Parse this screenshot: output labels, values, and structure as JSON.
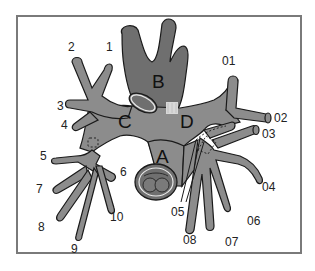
{
  "diagram": {
    "type": "bronchial-tree schematic",
    "colors": {
      "airway_fill": "#8c8c8c",
      "trunk_fill": "#6f6f6f",
      "outline": "#1a1a1a",
      "frame": "#7a7a7a",
      "background": "#ffffff",
      "ring_highlight": "#e8e8e8",
      "cartilage_highlight": "#d8d8d8"
    },
    "regions": {
      "A": "A",
      "B": "B",
      "C": "C",
      "D": "D"
    },
    "left_branches": [
      "1",
      "2",
      "3",
      "4",
      "5",
      "6",
      "7",
      "8",
      "9",
      "10"
    ],
    "right_branches": [
      "01",
      "02",
      "03",
      "04",
      "05",
      "06",
      "07",
      "08"
    ]
  }
}
